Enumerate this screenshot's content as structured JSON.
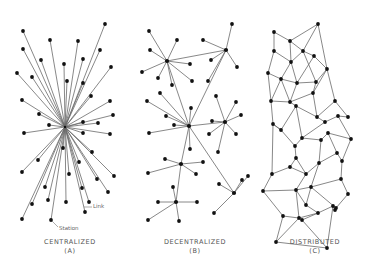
{
  "figure": {
    "panels": [
      {
        "id": "A",
        "title": "CENTRALIZED",
        "letter": "(A)",
        "hub": [
          65,
          127
        ],
        "nodes": [
          [
            23,
            31
          ],
          [
            105,
            24
          ],
          [
            23,
            49
          ],
          [
            50,
            40
          ],
          [
            41,
            60
          ],
          [
            78,
            41
          ],
          [
            100,
            50
          ],
          [
            64,
            64
          ],
          [
            17,
            73
          ],
          [
            32,
            77
          ],
          [
            83,
            59
          ],
          [
            111,
            67
          ],
          [
            67,
            81
          ],
          [
            83,
            83
          ],
          [
            91,
            96
          ],
          [
            22,
            100
          ],
          [
            110,
            101
          ],
          [
            39,
            114
          ],
          [
            113,
            115
          ],
          [
            49,
            125
          ],
          [
            83,
            122
          ],
          [
            98,
            123
          ],
          [
            24,
            133
          ],
          [
            83,
            133
          ],
          [
            110,
            134
          ],
          [
            63,
            148
          ],
          [
            92,
            152
          ],
          [
            38,
            160
          ],
          [
            79,
            162
          ],
          [
            22,
            172
          ],
          [
            69,
            174
          ],
          [
            114,
            176
          ],
          [
            97,
            179
          ],
          [
            82,
            188
          ],
          [
            45,
            187
          ],
          [
            108,
            192
          ],
          [
            48,
            200
          ],
          [
            89,
            202
          ],
          [
            32,
            204
          ],
          [
            66,
            202
          ],
          [
            85,
            212
          ],
          [
            22,
            219
          ],
          [
            51,
            220
          ]
        ]
      },
      {
        "id": "B",
        "title": "DECENTRALIZED",
        "letter": "(B)",
        "hubs": [
          [
            167,
            61
          ],
          [
            226,
            50
          ],
          [
            189,
            126
          ],
          [
            225,
            122
          ],
          [
            181,
            164
          ],
          [
            176,
            202
          ],
          [
            234,
            193
          ]
        ],
        "hub_links": [
          [
            0,
            1
          ],
          [
            0,
            2
          ],
          [
            1,
            2
          ],
          [
            2,
            3
          ],
          [
            2,
            4
          ],
          [
            2,
            6
          ],
          [
            4,
            5
          ]
        ],
        "leaves": [
          [
            0,
            149,
            31
          ],
          [
            0,
            177,
            40
          ],
          [
            0,
            150,
            50
          ],
          [
            0,
            142,
            72
          ],
          [
            0,
            190,
            64
          ],
          [
            0,
            158,
            78
          ],
          [
            0,
            192,
            81
          ],
          [
            0,
            172,
            85
          ],
          [
            1,
            232,
            24
          ],
          [
            1,
            203,
            40
          ],
          [
            1,
            211,
            60
          ],
          [
            1,
            237,
            67
          ],
          [
            1,
            208,
            81
          ],
          [
            2,
            147,
            101
          ],
          [
            2,
            160,
            93
          ],
          [
            2,
            166,
            116
          ],
          [
            2,
            174,
            125
          ],
          [
            2,
            149,
            133
          ],
          [
            2,
            191,
            108
          ],
          [
            2,
            190,
            149
          ],
          [
            3,
            216,
            96
          ],
          [
            3,
            236,
            102
          ],
          [
            3,
            241,
            115
          ],
          [
            3,
            209,
            134
          ],
          [
            3,
            236,
            134
          ],
          [
            3,
            212,
            121
          ],
          [
            3,
            218,
            152
          ],
          [
            4,
            165,
            159
          ],
          [
            4,
            203,
            162
          ],
          [
            4,
            148,
            173
          ],
          [
            4,
            196,
            174
          ],
          [
            5,
            173,
            187
          ],
          [
            5,
            158,
            202
          ],
          [
            5,
            197,
            202
          ],
          [
            5,
            148,
            220
          ],
          [
            5,
            179,
            221
          ],
          [
            6,
            242,
            180
          ],
          [
            6,
            219,
            184
          ],
          [
            6,
            214,
            213
          ],
          [
            6,
            248,
            176
          ]
        ]
      },
      {
        "id": "C",
        "title": "DISTRIBUTED",
        "letter": "(C)",
        "nodes": [
          [
            274,
            32
          ],
          [
            290,
            41
          ],
          [
            318,
            24
          ],
          [
            274,
            51
          ],
          [
            268,
            73
          ],
          [
            291,
            62
          ],
          [
            303,
            51
          ],
          [
            314,
            56
          ],
          [
            281,
            79
          ],
          [
            297,
            83
          ],
          [
            316,
            82
          ],
          [
            327,
            69
          ],
          [
            296,
            106
          ],
          [
            313,
            93
          ],
          [
            290,
            102
          ],
          [
            273,
            124
          ],
          [
            271,
            101
          ],
          [
            317,
            117
          ],
          [
            335,
            101
          ],
          [
            325,
            122
          ],
          [
            338,
            116
          ],
          [
            302,
            138
          ],
          [
            321,
            140
          ],
          [
            295,
            146
          ],
          [
            281,
            130
          ],
          [
            296,
            158
          ],
          [
            328,
            133
          ],
          [
            348,
            117
          ],
          [
            351,
            139
          ],
          [
            272,
            174
          ],
          [
            290,
            167
          ],
          [
            306,
            174
          ],
          [
            337,
            153
          ],
          [
            319,
            163
          ],
          [
            342,
            161
          ],
          [
            311,
            187
          ],
          [
            341,
            179
          ],
          [
            296,
            190
          ],
          [
            263,
            191
          ],
          [
            306,
            205
          ],
          [
            348,
            194
          ],
          [
            336,
            208
          ],
          [
            283,
            216
          ],
          [
            299,
            218
          ],
          [
            318,
            213
          ],
          [
            333,
            206
          ],
          [
            276,
            242
          ],
          [
            302,
            220
          ],
          [
            327,
            248
          ],
          [
            335,
            210
          ]
        ],
        "edges": [
          [
            0,
            1
          ],
          [
            1,
            2
          ],
          [
            0,
            3
          ],
          [
            1,
            5
          ],
          [
            1,
            6
          ],
          [
            2,
            6
          ],
          [
            2,
            11
          ],
          [
            3,
            5
          ],
          [
            3,
            4
          ],
          [
            5,
            6
          ],
          [
            5,
            8
          ],
          [
            5,
            9
          ],
          [
            6,
            7
          ],
          [
            7,
            9
          ],
          [
            7,
            11
          ],
          [
            6,
            10
          ],
          [
            10,
            11
          ],
          [
            4,
            8
          ],
          [
            4,
            16
          ],
          [
            8,
            9
          ],
          [
            8,
            16
          ],
          [
            8,
            14
          ],
          [
            9,
            10
          ],
          [
            9,
            14
          ],
          [
            10,
            13
          ],
          [
            11,
            13
          ],
          [
            11,
            18
          ],
          [
            13,
            14
          ],
          [
            13,
            17
          ],
          [
            14,
            16
          ],
          [
            14,
            12
          ],
          [
            12,
            17
          ],
          [
            12,
            21
          ],
          [
            16,
            15
          ],
          [
            15,
            24
          ],
          [
            24,
            12
          ],
          [
            17,
            18
          ],
          [
            18,
            27
          ],
          [
            17,
            19
          ],
          [
            19,
            21
          ],
          [
            19,
            20
          ],
          [
            20,
            27
          ],
          [
            20,
            28
          ],
          [
            21,
            22
          ],
          [
            22,
            26
          ],
          [
            26,
            28
          ],
          [
            21,
            23
          ],
          [
            23,
            24
          ],
          [
            24,
            15
          ],
          [
            15,
            29
          ],
          [
            23,
            25
          ],
          [
            25,
            30
          ],
          [
            29,
            30
          ],
          [
            30,
            31
          ],
          [
            25,
            31
          ],
          [
            31,
            33
          ],
          [
            22,
            33
          ],
          [
            33,
            32
          ],
          [
            32,
            34
          ],
          [
            26,
            32
          ],
          [
            28,
            34
          ],
          [
            33,
            35
          ],
          [
            35,
            36
          ],
          [
            34,
            36
          ],
          [
            31,
            37
          ],
          [
            37,
            35
          ],
          [
            29,
            38
          ],
          [
            38,
            37
          ],
          [
            37,
            39
          ],
          [
            39,
            35
          ],
          [
            36,
            40
          ],
          [
            40,
            41
          ],
          [
            35,
            41
          ],
          [
            38,
            42
          ],
          [
            42,
            43
          ],
          [
            43,
            37
          ],
          [
            43,
            44
          ],
          [
            44,
            39
          ],
          [
            44,
            45
          ],
          [
            45,
            41
          ],
          [
            42,
            46
          ],
          [
            46,
            43
          ],
          [
            43,
            47
          ],
          [
            47,
            44
          ],
          [
            46,
            48
          ],
          [
            48,
            45
          ],
          [
            47,
            48
          ],
          [
            41,
            49
          ]
        ]
      }
    ],
    "annotations": {
      "link_label": "Link",
      "station_label": "Station"
    }
  }
}
